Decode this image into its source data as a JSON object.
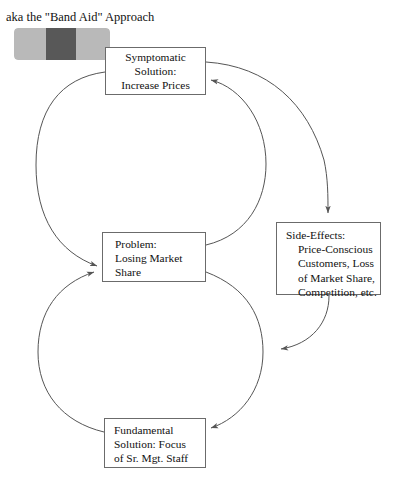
{
  "diagram": {
    "caption": "aka the \"Band Aid\" Approach",
    "type": "causal-loop-diagram",
    "colors": {
      "bandaid_strip": "#b9b9b9",
      "bandaid_pad": "#585858",
      "box_border": "#6b6b6b",
      "arrow": "#555555",
      "text": "#111111",
      "background": "#ffffff"
    },
    "bandaid": {
      "name": "band-aid-graphic",
      "strip_color": "#b9b9b9",
      "pad_color": "#585858"
    },
    "nodes": [
      {
        "id": "symptomatic",
        "text": "Symptomatic\nSolution:\nIncrease Prices"
      },
      {
        "id": "problem",
        "text": "Problem:\nLosing Market\nShare"
      },
      {
        "id": "side_effects",
        "head": "Side-Effects:",
        "body": "Price-Conscious\nCustomers, Loss\nof Market Share,\nCompetition, etc."
      },
      {
        "id": "fundamental",
        "text": "Fundamental\nSolution: Focus\nof Sr. Mgt. Staff"
      }
    ],
    "edges": [
      {
        "id": "symptomatic-to-problem",
        "from": "symptomatic",
        "to": "problem",
        "shape": "left-arc"
      },
      {
        "id": "problem-to-symptomatic",
        "from": "problem",
        "to": "symptomatic",
        "shape": "right-arc"
      },
      {
        "id": "symptomatic-to-side-effects",
        "from": "symptomatic",
        "to": "side_effects",
        "shape": "right-outer-arc"
      },
      {
        "id": "side-effects-to-lower-loop",
        "from": "side_effects",
        "to": "problem-fundamental-arc",
        "shape": "curve"
      },
      {
        "id": "problem-to-fundamental",
        "from": "problem",
        "to": "fundamental",
        "shape": "right-arc"
      },
      {
        "id": "fundamental-to-problem",
        "from": "fundamental",
        "to": "problem",
        "shape": "left-arc"
      }
    ]
  }
}
